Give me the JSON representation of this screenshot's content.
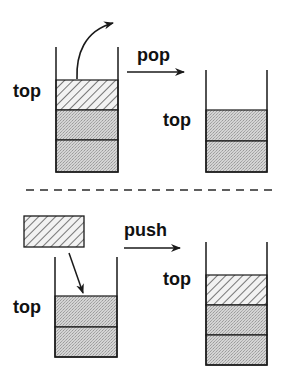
{
  "diagram": {
    "colors": {
      "ink": "#1a1a1a",
      "gray_fill": "#cfcfcf",
      "hatch_bg": "#f2f2f2",
      "background": "#ffffff"
    },
    "pop_section": {
      "operation_label": "pop",
      "before": {
        "top_label": "top",
        "blocks": [
          "hatched",
          "gray",
          "gray"
        ]
      },
      "after": {
        "top_label": "top",
        "blocks": [
          "gray",
          "gray"
        ]
      }
    },
    "separator": "dashed",
    "push_section": {
      "operation_label": "push",
      "incoming_block": "hatched",
      "before": {
        "top_label": "top",
        "blocks": [
          "gray",
          "gray"
        ]
      },
      "after": {
        "top_label": "top",
        "blocks": [
          "hatched",
          "gray",
          "gray"
        ]
      }
    }
  }
}
